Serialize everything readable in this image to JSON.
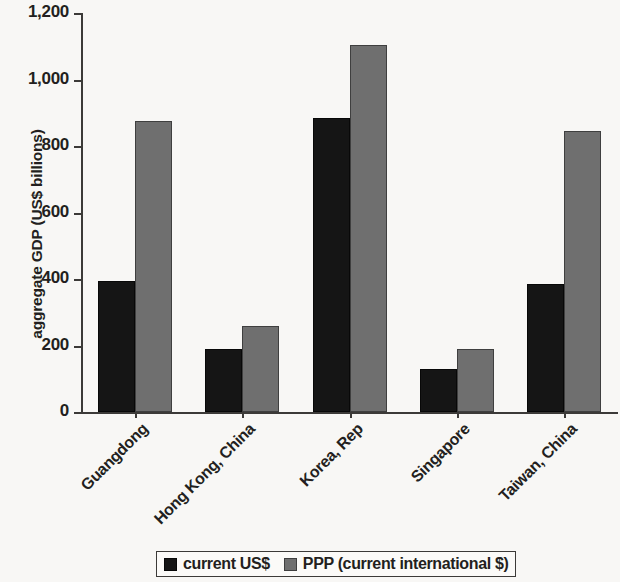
{
  "chart_data": {
    "type": "bar",
    "title": "",
    "subtitle": "",
    "xlabel": "",
    "ylabel": "aggregate GDP (US$ billions)",
    "categories": [
      "Guangdong",
      "Hong Kong, China",
      "Korea, Rep",
      "Singapore",
      "Taiwan, China"
    ],
    "series": [
      {
        "name": "current US$",
        "color": "#151515",
        "values": [
          395,
          190,
          885,
          130,
          385
        ]
      },
      {
        "name": "PPP (current international $)",
        "color": "#6f6f6f",
        "values": [
          875,
          260,
          1105,
          190,
          845
        ]
      }
    ],
    "ylim": [
      0,
      1200
    ],
    "ytick_values": [
      0,
      200,
      400,
      600,
      800,
      1000,
      1200
    ],
    "ytick_labels": [
      "0",
      "200",
      "400",
      "600",
      "800",
      "1,000",
      "1,200"
    ],
    "grid": false,
    "legend_position": "bottom",
    "xtick_label_rotation": -45
  },
  "legend": {
    "entries": [
      {
        "label": "current US$"
      },
      {
        "label": "PPP (current international $)"
      }
    ]
  }
}
